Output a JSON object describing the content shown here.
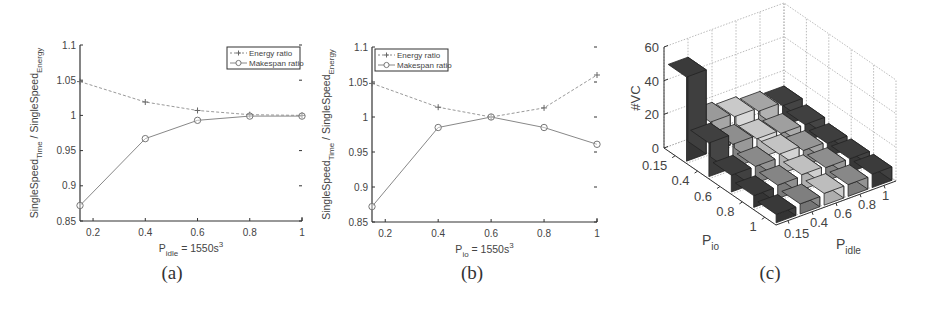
{
  "figure": {
    "captions": [
      "(a)",
      "(b)",
      "(c)"
    ]
  },
  "chart_data": [
    {
      "id": "a",
      "type": "line",
      "title": "",
      "xlabel": "P_idle = 1550s^3",
      "xlabel_main": "P",
      "xlabel_sub": "idle",
      "xlabel_rest": " = 1550s",
      "xlabel_sup": "3",
      "ylabel": "SingleSpeed_Time / SingleSpeed_Energy",
      "ylabel_a": "SingleSpeed",
      "ylabel_a_sub": "Time",
      "ylabel_b": " / SingleSpeed",
      "ylabel_b_sub": "Energy",
      "x": [
        0.15,
        0.4,
        0.6,
        0.8,
        1.0
      ],
      "xlim": [
        0.15,
        1.0
      ],
      "ylim": [
        0.85,
        1.1
      ],
      "xticks": [
        "0.2",
        "0.4",
        "0.6",
        "0.8",
        "1"
      ],
      "yticks": [
        "0.85",
        "0.9",
        "0.95",
        "1",
        "1.05",
        "1.1"
      ],
      "legend_position": "upper right",
      "grid": false,
      "series": [
        {
          "name": "Energy ratio",
          "marker": "+",
          "linestyle": "dashed",
          "values": [
            1.048,
            1.019,
            1.007,
            1.001,
            1.0
          ]
        },
        {
          "name": "Makespan ratio",
          "marker": "o",
          "linestyle": "solid",
          "values": [
            0.872,
            0.967,
            0.993,
            0.999,
            0.999
          ]
        }
      ]
    },
    {
      "id": "b",
      "type": "line",
      "title": "",
      "xlabel": "P_io = 1550s^3",
      "xlabel_main": "P",
      "xlabel_sub": "io",
      "xlabel_rest": " = 1550s",
      "xlabel_sup": "3",
      "ylabel": "SingleSpeed_Time / SingleSpeed_Energy",
      "ylabel_a": "SingleSpeed",
      "ylabel_a_sub": "Time",
      "ylabel_b": " / SingleSpeed",
      "ylabel_b_sub": "Energy",
      "x": [
        0.15,
        0.4,
        0.6,
        0.8,
        1.0
      ],
      "xlim": [
        0.15,
        1.0
      ],
      "ylim": [
        0.85,
        1.1
      ],
      "xticks": [
        "0.2",
        "0.4",
        "0.6",
        "0.8",
        "1"
      ],
      "yticks": [
        "0.85",
        "0.9",
        "0.95",
        "1",
        "1.05",
        "1.1"
      ],
      "legend_position": "upper left",
      "grid": false,
      "series": [
        {
          "name": "Energy ratio",
          "marker": "+",
          "linestyle": "dashed",
          "values": [
            1.048,
            1.014,
            1.0,
            1.013,
            1.06
          ]
        },
        {
          "name": "Makespan ratio",
          "marker": "o",
          "linestyle": "solid",
          "values": [
            0.872,
            0.985,
            1.0,
            0.985,
            0.961
          ]
        }
      ]
    },
    {
      "id": "c",
      "type": "bar3d",
      "title": "",
      "zlabel": "#VC",
      "xlabel": "P_io",
      "xlabel_main": "P",
      "xlabel_sub": "io",
      "ylabel": "P_idle",
      "ylabel_main": "P",
      "ylabel_sub": "idle",
      "zlim": [
        0,
        60
      ],
      "zticks": [
        "0",
        "20",
        "40",
        "60"
      ],
      "x_categories": [
        "0.15",
        "0.4",
        "0.6",
        "0.8",
        "1"
      ],
      "y_categories": [
        "0.15",
        "0.4",
        "0.6",
        "0.8",
        "1"
      ],
      "grid": true,
      "values_note": "rows = P_io (0.15..1), columns = P_idle (0.15..1)",
      "values": [
        [
          50,
          18,
          16,
          14,
          12
        ],
        [
          20,
          14,
          12,
          10,
          10
        ],
        [
          10,
          10,
          12,
          9,
          8
        ],
        [
          7,
          8,
          9,
          8,
          8
        ],
        [
          5,
          6,
          7,
          7,
          8
        ]
      ],
      "shades": [
        [
          "#3a3a3a",
          "#9a9a9a",
          "#c9c9c9",
          "#a5a5a5",
          "#3f3f3f"
        ],
        [
          "#404040",
          "#8e8e8e",
          "#c7c7c7",
          "#9f9f9f",
          "#404040"
        ],
        [
          "#3c3c3c",
          "#8a8a8a",
          "#c3c3c3",
          "#969696",
          "#3e3e3e"
        ],
        [
          "#3a3a3a",
          "#858585",
          "#c0c0c0",
          "#8e8e8e",
          "#3d3d3d"
        ],
        [
          "#393939",
          "#7f7f7f",
          "#bdbdbd",
          "#888888",
          "#3b3b3b"
        ]
      ]
    }
  ]
}
